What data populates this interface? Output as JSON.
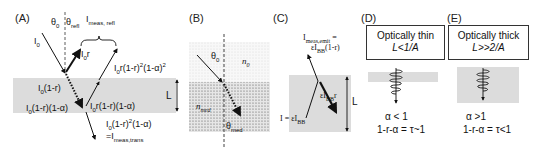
{
  "panels": {
    "A": {
      "letter": "(A)",
      "theta0": "θ",
      "theta0_sub": "0",
      "theta_refl": "θ",
      "theta_refl_sub": "refl",
      "i_meas_refl": "I",
      "i_meas_refl_sub": "meas, refl",
      "i0": "I",
      "i0_sub": "0",
      "i0r_main": "I",
      "i0r_sub": "0",
      "i0r_tail": "r",
      "i0_1mr_main": "I",
      "i0_1mr_sub": "0",
      "i0_1mr_tail": "(1-r)",
      "i0_1mr_1ma_main": "I",
      "i0_1mr_1ma_sub": "0",
      "i0_1mr_1ma_tail": "(1-r)(1-α)",
      "i0r_1mr_1ma_main": "I",
      "i0r_1mr_1ma_sub": "0",
      "i0r_1mr_1ma_tail": "r(1-r)(1-α)",
      "i0r_1mr2_1ma2_main": "I",
      "i0r_1mr2_1ma2_sub": "0",
      "i0r_1mr2_1ma2_mid": "r(1-r)",
      "i0r_1mr2_1ma2_sup1": "2",
      "i0r_1mr2_1ma2_mid2": "(1-α)",
      "i0r_1mr2_1ma2_sup2": "2",
      "trans_main": "I",
      "trans_sub": "0",
      "trans_mid": "(1-r)",
      "trans_sup": "2",
      "trans_tail": "(1-α)",
      "trans_eq": "=I",
      "trans_eq_sub": "meas,trans",
      "L": "L"
    },
    "B": {
      "letter": "(B)",
      "theta0": "θ",
      "theta0_sub": "0",
      "n0": "n",
      "n0_sub": "0",
      "nmed": "n",
      "nmed_sub": "med",
      "theta_med": "θ",
      "theta_med_sub": "med"
    },
    "C": {
      "letter": "(C)",
      "emit_line1": "I",
      "emit_line1_sub": "meas,emit",
      "emit_line1_tail": " =",
      "emit_line2": "εI",
      "emit_line2_sub": "BB",
      "emit_line2_tail": "(1-r)",
      "eps_ibb_r": "εI",
      "eps_ibb_r_sub": "BB",
      "eps_ibb_r_tail": "r",
      "i_eq": "I = εI",
      "i_eq_sub": "BB",
      "L": "L"
    },
    "D": {
      "letter": "(D)",
      "box_line1": "Optically thin",
      "box_line2": "L<1/A",
      "alpha": "α < 1",
      "relation": "1-r-α = τ~1"
    },
    "E": {
      "letter": "(E)",
      "box_line1": "Optically thick",
      "box_line2": "L>>2/A",
      "alpha": "α >1",
      "relation": "1-r-α = τ<1"
    }
  },
  "colors": {
    "medium_gray": "#dcdcdc",
    "ink": "#111111"
  }
}
